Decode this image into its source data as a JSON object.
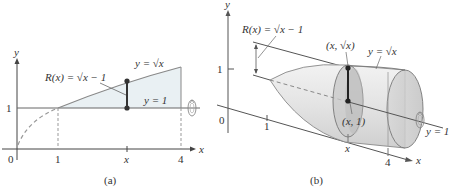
{
  "figure_a": {
    "caption": "(a)",
    "axis_x_label": "x",
    "axis_y_label": "y",
    "origin_label": "0",
    "tick_x_1": "1",
    "tick_x_x": "x",
    "tick_x_4": "4",
    "tick_y_1": "1",
    "curve_label": "y = √x",
    "line_label": "y = 1",
    "radius_label": "R(x) = √x − 1",
    "colors": {
      "region_fill": "#e9f0f3",
      "curve": "#808080",
      "axis": "#444444",
      "dashed": "#999999",
      "point": "#333333"
    }
  },
  "figure_b": {
    "caption": "(b)",
    "axis_x_label": "x",
    "axis_y_label": "y",
    "origin_label": "0",
    "tick_x_1": "1",
    "tick_x_x": "x",
    "tick_x_4": "4",
    "tick_y_1": "1",
    "curve_label": "y = √x",
    "line_label": "y = 1",
    "radius_label": "R(x) = √x − 1",
    "point_top_label": "(x, √x)",
    "point_bottom_label": "(x, 1)",
    "colors": {
      "solid_light": "#e6e6e6",
      "solid_mid": "#cfcfcf",
      "solid_dark": "#b5b5b5",
      "edge": "#777777"
    }
  },
  "icons": [
    "rotation-arrow-icon"
  ]
}
